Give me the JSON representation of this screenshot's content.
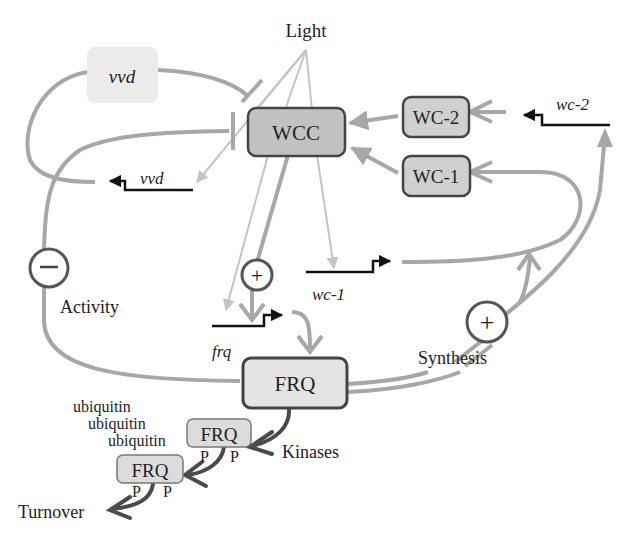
{
  "diagram": {
    "type": "circadian-clock-feedback-network",
    "colors": {
      "line_gray": "#a7a7a7",
      "light_gray": "#c4c4c4",
      "dark_line": "#4a4a4a",
      "gene_black": "#111111",
      "wcc_fill": "#c2c2c2",
      "wc_fill": "#d0d0d0",
      "frq_fill": "#e4e4e4",
      "vvd_fill": "#ebebeb",
      "box_border": "#444444"
    },
    "labels": {
      "light": "Light",
      "activity": "Activity",
      "synthesis": "Synthesis",
      "kinases": "Kinases",
      "turnover": "Turnover"
    },
    "proteins": {
      "vvd": "vvd",
      "wcc": "WCC",
      "wc2": "WC-2",
      "wc1": "WC-1",
      "frq_main": "FRQ",
      "frq_p1": "FRQ",
      "frq_p2": "FRQ"
    },
    "genes": {
      "vvd": "vvd",
      "wc2": "wc-2",
      "wc1": "wc-1",
      "frq": "frq"
    },
    "signs": {
      "minus": "−",
      "plus_frq": "+",
      "plus_synthesis": "+"
    },
    "modifications": {
      "ubiquitin": [
        "ubiquitin",
        "ubiquitin",
        "ubiquitin"
      ],
      "phospho_p1": [
        "P",
        "P"
      ],
      "phospho_p2": [
        "P",
        "P"
      ]
    }
  }
}
